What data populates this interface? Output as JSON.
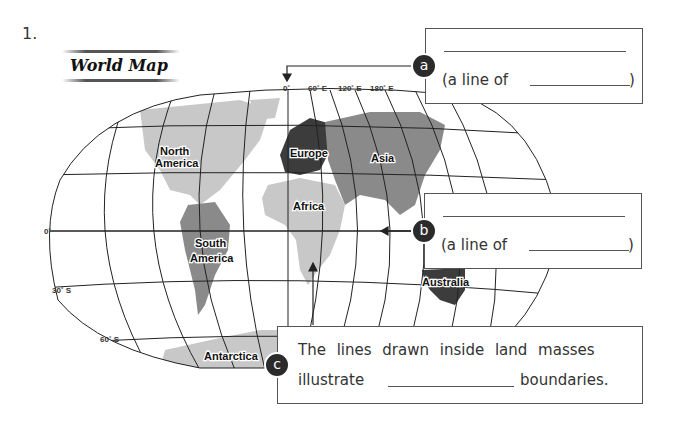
{
  "question_number": "1.",
  "map": {
    "title": "World Map",
    "longitude_labels": [
      "0˚",
      "60˚ E",
      "120˚ E",
      "180˚ E"
    ],
    "latitude_labels": [
      "0˚",
      "30˚ S",
      "60˚ S"
    ],
    "continents": [
      "North America",
      "South America",
      "Europe",
      "Asia",
      "Africa",
      "Australia",
      "Antarctica"
    ]
  },
  "boxes": {
    "a": {
      "badge": "a",
      "line_of_prefix": "(a line of",
      "line_of_suffix": ")"
    },
    "b": {
      "badge": "b",
      "line_of_prefix": "(a line of",
      "line_of_suffix": ")"
    },
    "c": {
      "badge": "c",
      "line1": "The lines drawn inside land masses",
      "line2_prefix": "illustrate",
      "line2_suffix": "boundaries."
    }
  },
  "colors": {
    "land_light": "#c8c8c8",
    "land_mid": "#8a8a8a",
    "land_dark": "#3c3c3c",
    "grid": "#222222"
  }
}
